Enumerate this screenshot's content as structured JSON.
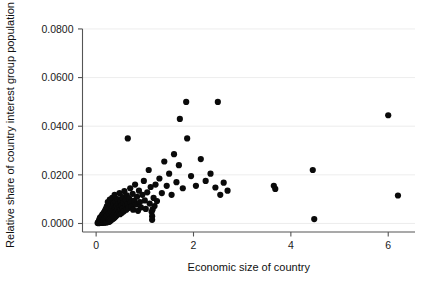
{
  "chart_data": {
    "type": "scatter",
    "title": "",
    "xlabel": "Economic size of country",
    "ylabel": "Relative share of country interest group population",
    "xlim": [
      -0.28,
      6.55
    ],
    "ylim": [
      -0.0035,
      0.0845
    ],
    "xticks": [
      0,
      2,
      4,
      6
    ],
    "xticklabels": [
      "0",
      "2",
      "4",
      "6"
    ],
    "yticks": [
      0.0,
      0.02,
      0.04,
      0.06,
      0.08
    ],
    "yticklabels": [
      "0.0000",
      "0.0200",
      "0.0400",
      "0.0600",
      "0.0800"
    ],
    "grid": "horizontal",
    "legend": "none",
    "marker": "filled-circle",
    "marker_color": "#0a0a0a",
    "marker_size": 3.1,
    "n_points": 178,
    "points": [
      [
        0.03,
        0.0002
      ],
      [
        0.04,
        0.0004
      ],
      [
        0.05,
        0.0001
      ],
      [
        0.05,
        0.0008
      ],
      [
        0.06,
        0.0003
      ],
      [
        0.06,
        0.0012
      ],
      [
        0.07,
        0.0006
      ],
      [
        0.07,
        0.0018
      ],
      [
        0.08,
        0.0002
      ],
      [
        0.08,
        0.001
      ],
      [
        0.08,
        0.0024
      ],
      [
        0.09,
        0.0005
      ],
      [
        0.09,
        0.0015
      ],
      [
        0.1,
        0.0003
      ],
      [
        0.1,
        0.0009
      ],
      [
        0.1,
        0.0021
      ],
      [
        0.11,
        0.0007
      ],
      [
        0.11,
        0.003
      ],
      [
        0.12,
        0.0002
      ],
      [
        0.12,
        0.0013
      ],
      [
        0.12,
        0.0026
      ],
      [
        0.13,
        0.0005
      ],
      [
        0.13,
        0.0017
      ],
      [
        0.13,
        0.0038
      ],
      [
        0.14,
        0.0009
      ],
      [
        0.14,
        0.0022
      ],
      [
        0.15,
        0.0004
      ],
      [
        0.15,
        0.0012
      ],
      [
        0.15,
        0.0033
      ],
      [
        0.16,
        0.0007
      ],
      [
        0.16,
        0.0019
      ],
      [
        0.16,
        0.0045
      ],
      [
        0.17,
        0.0003
      ],
      [
        0.17,
        0.0014
      ],
      [
        0.17,
        0.0028
      ],
      [
        0.18,
        0.0008
      ],
      [
        0.18,
        0.0023
      ],
      [
        0.18,
        0.0052
      ],
      [
        0.19,
        0.0005
      ],
      [
        0.19,
        0.0016
      ],
      [
        0.19,
        0.0036
      ],
      [
        0.2,
        0.001
      ],
      [
        0.2,
        0.0027
      ],
      [
        0.2,
        0.006
      ],
      [
        0.21,
        0.0004
      ],
      [
        0.21,
        0.0018
      ],
      [
        0.21,
        0.0041
      ],
      [
        0.22,
        0.0008
      ],
      [
        0.22,
        0.0031
      ],
      [
        0.22,
        0.007
      ],
      [
        0.23,
        0.0013
      ],
      [
        0.23,
        0.0024
      ],
      [
        0.23,
        0.0048
      ],
      [
        0.24,
        0.0006
      ],
      [
        0.24,
        0.0035
      ],
      [
        0.24,
        0.0088
      ],
      [
        0.25,
        0.0011
      ],
      [
        0.25,
        0.0021
      ],
      [
        0.25,
        0.0056
      ],
      [
        0.26,
        0.0015
      ],
      [
        0.26,
        0.0039
      ],
      [
        0.27,
        0.0007
      ],
      [
        0.27,
        0.0029
      ],
      [
        0.27,
        0.0064
      ],
      [
        0.28,
        0.0018
      ],
      [
        0.28,
        0.0044
      ],
      [
        0.28,
        0.0098
      ],
      [
        0.29,
        0.001
      ],
      [
        0.29,
        0.0033
      ],
      [
        0.3,
        0.0022
      ],
      [
        0.3,
        0.0051
      ],
      [
        0.3,
        0.0076
      ],
      [
        0.31,
        0.0014
      ],
      [
        0.31,
        0.0038
      ],
      [
        0.32,
        0.0026
      ],
      [
        0.32,
        0.006
      ],
      [
        0.33,
        0.0017
      ],
      [
        0.33,
        0.0043
      ],
      [
        0.33,
        0.0105
      ],
      [
        0.34,
        0.003
      ],
      [
        0.34,
        0.0069
      ],
      [
        0.35,
        0.002
      ],
      [
        0.35,
        0.0049
      ],
      [
        0.36,
        0.0034
      ],
      [
        0.36,
        0.0082
      ],
      [
        0.37,
        0.0023
      ],
      [
        0.37,
        0.0055
      ],
      [
        0.38,
        0.004
      ],
      [
        0.38,
        0.0118
      ],
      [
        0.39,
        0.0027
      ],
      [
        0.39,
        0.0063
      ],
      [
        0.4,
        0.0046
      ],
      [
        0.4,
        0.009
      ],
      [
        0.41,
        0.0031
      ],
      [
        0.42,
        0.0072
      ],
      [
        0.42,
        0.0052
      ],
      [
        0.43,
        0.0036
      ],
      [
        0.44,
        0.01
      ],
      [
        0.44,
        0.0059
      ],
      [
        0.45,
        0.0042
      ],
      [
        0.46,
        0.008
      ],
      [
        0.47,
        0.0048
      ],
      [
        0.48,
        0.0066
      ],
      [
        0.48,
        0.0125
      ],
      [
        0.49,
        0.0038
      ],
      [
        0.5,
        0.0091
      ],
      [
        0.5,
        0.0056
      ],
      [
        0.52,
        0.0074
      ],
      [
        0.53,
        0.0044
      ],
      [
        0.54,
        0.0108
      ],
      [
        0.55,
        0.0063
      ],
      [
        0.56,
        0.0085
      ],
      [
        0.57,
        0.005
      ],
      [
        0.58,
        0.0133
      ],
      [
        0.6,
        0.0071
      ],
      [
        0.61,
        0.0096
      ],
      [
        0.62,
        0.0057
      ],
      [
        0.63,
        0.0116
      ],
      [
        0.64,
        0.0079
      ],
      [
        0.65,
        0.035
      ],
      [
        0.66,
        0.0064
      ],
      [
        0.68,
        0.0102
      ],
      [
        0.7,
        0.0145
      ],
      [
        0.71,
        0.0086
      ],
      [
        0.73,
        0.007
      ],
      [
        0.75,
        0.0122
      ],
      [
        0.76,
        0.0057
      ],
      [
        0.78,
        0.0094
      ],
      [
        0.8,
        0.016
      ],
      [
        0.82,
        0.0078
      ],
      [
        0.84,
        0.011
      ],
      [
        0.86,
        0.0052
      ],
      [
        0.88,
        0.0135
      ],
      [
        0.9,
        0.0088
      ],
      [
        0.92,
        0.0066
      ],
      [
        0.95,
        0.0118
      ],
      [
        0.98,
        0.0175
      ],
      [
        1.0,
        0.0095
      ],
      [
        1.02,
        0.006
      ],
      [
        1.05,
        0.0128
      ],
      [
        1.08,
        0.022
      ],
      [
        1.1,
        0.0082
      ],
      [
        1.12,
        0.015
      ],
      [
        1.14,
        0.0048
      ],
      [
        1.15,
        0.003
      ],
      [
        1.15,
        0.0015
      ],
      [
        1.16,
        0.0058
      ],
      [
        1.18,
        0.0105
      ],
      [
        1.2,
        0.0072
      ],
      [
        1.22,
        0.016
      ],
      [
        1.25,
        0.0092
      ],
      [
        1.3,
        0.0185
      ],
      [
        1.35,
        0.0125
      ],
      [
        1.4,
        0.0255
      ],
      [
        1.45,
        0.0155
      ],
      [
        1.5,
        0.0205
      ],
      [
        1.55,
        0.0118
      ],
      [
        1.6,
        0.0285
      ],
      [
        1.65,
        0.017
      ],
      [
        1.7,
        0.024
      ],
      [
        1.72,
        0.043
      ],
      [
        1.78,
        0.0145
      ],
      [
        1.85,
        0.05
      ],
      [
        1.87,
        0.035
      ],
      [
        1.95,
        0.0195
      ],
      [
        2.05,
        0.0155
      ],
      [
        2.15,
        0.0265
      ],
      [
        2.25,
        0.0175
      ],
      [
        2.35,
        0.0205
      ],
      [
        2.45,
        0.0148
      ],
      [
        2.5,
        0.05
      ],
      [
        2.55,
        0.0118
      ],
      [
        2.62,
        0.0168
      ],
      [
        2.7,
        0.0135
      ],
      [
        3.65,
        0.0155
      ],
      [
        3.68,
        0.0142
      ],
      [
        4.45,
        0.022
      ],
      [
        4.48,
        0.0018
      ],
      [
        6.0,
        0.0445
      ],
      [
        6.2,
        0.0115
      ]
    ]
  }
}
